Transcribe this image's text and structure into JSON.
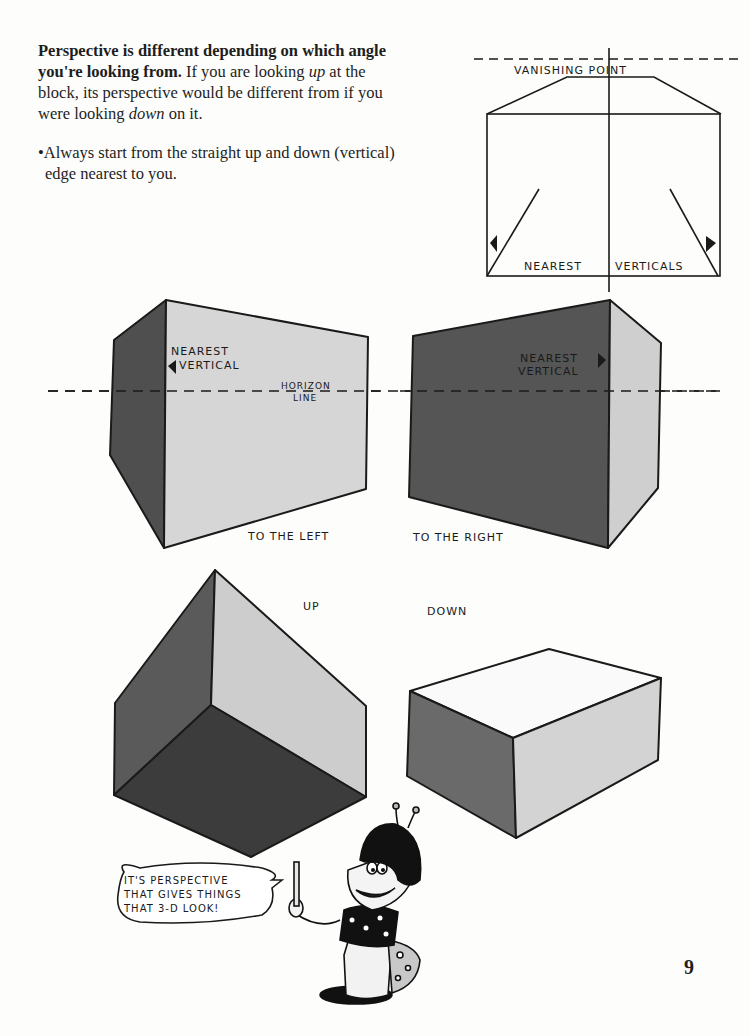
{
  "intro": {
    "lead_bold": "Perspective is different depending on which angle you're looking from.",
    "sentence_part1": " If you are looking ",
    "up_word": "up",
    "sentence_part2": " at the block, its perspective would be different from if you were looking ",
    "down_word": "down",
    "sentence_part3": " on it.",
    "bullet_char": "•",
    "bullet_text": "Always start from the straight up and down (vertical) edge nearest to you."
  },
  "diagram_top": {
    "vanishing_point_label": "VANISHING POINT",
    "nearest_verticals_left": "NEAREST",
    "nearest_verticals_right": "VERTICALS"
  },
  "block_left": {
    "nearest_label_line1": "NEAREST",
    "nearest_label_line2": "VERTICAL",
    "horizon_line1": "HORIZON",
    "horizon_line2": "LINE",
    "caption": "TO THE LEFT"
  },
  "block_right": {
    "nearest_label_line1": "NEAREST",
    "nearest_label_line2": "VERTICAL",
    "caption": "TO THE RIGHT"
  },
  "block_up": {
    "caption": "UP"
  },
  "block_down": {
    "caption": "DOWN"
  },
  "speech_bubble": {
    "line1": "IT'S PERSPECTIVE",
    "line2": "THAT GIVES THINGS",
    "line3": "THAT 3-D LOOK!"
  },
  "page_number": "9",
  "colors": {
    "dark_face": "#4a4a4a",
    "mid_face": "#6e6e6e",
    "light_face": "#cfcfcf",
    "paper": "#fdfdfb",
    "ink": "#1a1a1a"
  }
}
